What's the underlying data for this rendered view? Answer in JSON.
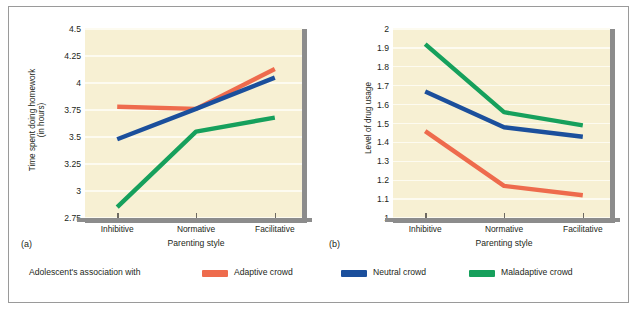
{
  "figure": {
    "panels": [
      {
        "label": "(a)",
        "ytitle": "Time spent doing homework\n(in hours)",
        "xtitle": "Parenting style"
      },
      {
        "label": "(b)",
        "ytitle": "Level of drug usage",
        "xtitle": "Parenting style"
      }
    ]
  },
  "legend": {
    "title": "Adolescent's association with",
    "items": [
      {
        "label": "Adaptive crowd",
        "color": "#ee6b4d"
      },
      {
        "label": "Neutral crowd",
        "color": "#1b4f9c"
      },
      {
        "label": "Maladaptive crowd",
        "color": "#16a05c"
      }
    ]
  },
  "chart_data": [
    {
      "type": "line",
      "panel": "(a)",
      "title": "",
      "xlabel": "Parenting style",
      "ylabel": "Time spent doing homework (in hours)",
      "categories": [
        "Inhibitive",
        "Normative",
        "Facilitative"
      ],
      "yticks": [
        2.75,
        3,
        3.25,
        3.5,
        3.75,
        4,
        4.25,
        4.5
      ],
      "ylim": [
        2.75,
        4.5
      ],
      "grid": true,
      "legend_position": "bottom",
      "series": [
        {
          "name": "Adaptive crowd",
          "color": "#ee6b4d",
          "values": [
            3.78,
            3.76,
            4.13
          ]
        },
        {
          "name": "Neutral crowd",
          "color": "#1b4f9c",
          "values": [
            3.48,
            3.76,
            4.05
          ]
        },
        {
          "name": "Maladaptive crowd",
          "color": "#16a05c",
          "values": [
            2.85,
            3.55,
            3.68
          ]
        }
      ]
    },
    {
      "type": "line",
      "panel": "(b)",
      "title": "",
      "xlabel": "Parenting style",
      "ylabel": "Level of drug usage",
      "categories": [
        "Inhibitive",
        "Normative",
        "Facilitative"
      ],
      "yticks": [
        1,
        1.1,
        1.2,
        1.3,
        1.4,
        1.5,
        1.6,
        1.7,
        1.8,
        1.9,
        2
      ],
      "ylim": [
        1,
        2
      ],
      "grid": true,
      "legend_position": "bottom",
      "series": [
        {
          "name": "Adaptive crowd",
          "color": "#ee6b4d",
          "values": [
            1.46,
            1.17,
            1.12
          ]
        },
        {
          "name": "Neutral crowd",
          "color": "#1b4f9c",
          "values": [
            1.67,
            1.48,
            1.43
          ]
        },
        {
          "name": "Maladaptive crowd",
          "color": "#16a05c",
          "values": [
            1.92,
            1.56,
            1.49
          ]
        }
      ]
    }
  ]
}
